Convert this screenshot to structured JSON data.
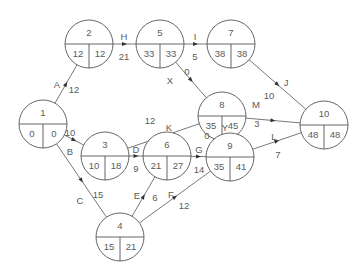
{
  "diagram": {
    "title": "",
    "type": "activity-on-arrow network",
    "node_radius": 24,
    "nodes": [
      {
        "id": "1",
        "x": 43,
        "y": 124,
        "es": "0",
        "lf": "0"
      },
      {
        "id": "2",
        "x": 89,
        "y": 44,
        "es": "12",
        "lf": "12"
      },
      {
        "id": "3",
        "x": 105,
        "y": 156,
        "es": "10",
        "lf": "18"
      },
      {
        "id": "4",
        "x": 120,
        "y": 237,
        "es": "15",
        "lf": "21"
      },
      {
        "id": "5",
        "x": 160,
        "y": 44,
        "es": "33",
        "lf": "33"
      },
      {
        "id": "6",
        "x": 167,
        "y": 156,
        "es": "21",
        "lf": "27"
      },
      {
        "id": "7",
        "x": 231,
        "y": 44,
        "es": "38",
        "lf": "38"
      },
      {
        "id": "8",
        "x": 222,
        "y": 116,
        "es": "35",
        "lf": "45"
      },
      {
        "id": "9",
        "x": 230,
        "y": 157,
        "es": "35",
        "lf": "41"
      },
      {
        "id": "10",
        "x": 324,
        "y": 125,
        "es": "48",
        "lf": "48"
      }
    ],
    "edges": [
      {
        "from": "1",
        "to": "2",
        "activity": "A",
        "duration": "12",
        "lx": 57,
        "ly": 85,
        "dx": 74,
        "dy": 90
      },
      {
        "from": "1",
        "to": "3",
        "activity": "B",
        "duration": "10",
        "lx": 70,
        "ly": 152,
        "dx": 70,
        "dy": 133
      },
      {
        "from": "1",
        "to": "4",
        "activity": "C",
        "duration": "15",
        "lx": 80,
        "ly": 201,
        "dx": 98,
        "dy": 195
      },
      {
        "from": "2",
        "to": "5",
        "activity": "H",
        "duration": "21",
        "lx": 124,
        "ly": 37,
        "dx": 124,
        "dy": 57
      },
      {
        "from": "3",
        "to": "6",
        "activity": "D",
        "duration": "9",
        "lx": 136,
        "ly": 150,
        "dx": 136,
        "dy": 169
      },
      {
        "from": "3",
        "to": "8",
        "activity": "K",
        "duration": "12",
        "lx": 169,
        "ly": 128,
        "dx": 150,
        "dy": 121
      },
      {
        "from": "4",
        "to": "6",
        "activity": "E",
        "duration": "6",
        "lx": 137,
        "ly": 196,
        "dx": 155,
        "dy": 198
      },
      {
        "from": "4",
        "to": "9",
        "activity": "F",
        "duration": "12",
        "lx": 171,
        "ly": 195,
        "dx": 184,
        "dy": 206
      },
      {
        "from": "5",
        "to": "7",
        "activity": "I",
        "duration": "5",
        "lx": 195,
        "ly": 37,
        "dx": 195,
        "dy": 57
      },
      {
        "from": "5",
        "to": "8",
        "activity": "X",
        "duration": "0",
        "lx": 170,
        "ly": 81,
        "dx": 187,
        "dy": 72
      },
      {
        "from": "6",
        "to": "9",
        "activity": "G",
        "duration": "14",
        "lx": 199,
        "ly": 150,
        "dx": 199,
        "dy": 170
      },
      {
        "from": "7",
        "to": "10",
        "activity": "J",
        "duration": "10",
        "lx": 286,
        "ly": 83,
        "dx": 269,
        "dy": 96
      },
      {
        "from": "8",
        "to": "10",
        "activity": "M",
        "duration": "3",
        "lx": 256,
        "ly": 105,
        "dx": 257,
        "dy": 124
      },
      {
        "from": "8",
        "to": "9",
        "activity": "Y",
        "duration": "0",
        "lx": 225,
        "ly": 128,
        "dx": 207,
        "dy": 136
      },
      {
        "from": "9",
        "to": "10",
        "activity": "L",
        "duration": "7",
        "lx": 274,
        "ly": 137,
        "dx": 278,
        "dy": 155
      }
    ]
  }
}
